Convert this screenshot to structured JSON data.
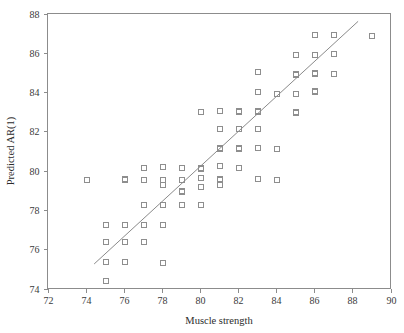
{
  "chart_data": {
    "type": "scatter",
    "title": "",
    "xlabel": "Muscle strength",
    "ylabel": "Predicted AR(1)",
    "xlim": [
      72,
      90
    ],
    "ylim": [
      74,
      88
    ],
    "xticks": [
      72,
      74,
      76,
      78,
      80,
      82,
      84,
      86,
      88,
      90
    ],
    "yticks": [
      74,
      76,
      78,
      80,
      82,
      84,
      86,
      88
    ],
    "grid": false,
    "legend": null,
    "marker": "open-square",
    "marker_color": "#8e8e8e",
    "line_color": "#8a8a8a",
    "frame_color": "#8c8c8c",
    "points": [
      [
        74.0,
        79.6
      ],
      [
        75.0,
        77.3
      ],
      [
        75.0,
        76.4
      ],
      [
        75.0,
        75.4
      ],
      [
        75.0,
        74.45
      ],
      [
        76.0,
        79.65
      ],
      [
        76.0,
        79.6
      ],
      [
        76.0,
        77.3
      ],
      [
        76.0,
        76.4
      ],
      [
        76.0,
        75.4
      ],
      [
        77.0,
        80.2
      ],
      [
        77.0,
        79.6
      ],
      [
        77.0,
        78.3
      ],
      [
        77.0,
        77.3
      ],
      [
        77.0,
        76.4
      ],
      [
        78.0,
        80.25
      ],
      [
        78.0,
        79.6
      ],
      [
        78.0,
        79.3
      ],
      [
        78.0,
        78.3
      ],
      [
        78.0,
        77.3
      ],
      [
        78.0,
        75.35
      ],
      [
        79.0,
        80.2
      ],
      [
        79.0,
        79.6
      ],
      [
        79.0,
        79.0
      ],
      [
        79.0,
        78.95
      ],
      [
        79.0,
        78.3
      ],
      [
        80.0,
        83.05
      ],
      [
        80.0,
        80.2
      ],
      [
        80.0,
        80.15
      ],
      [
        80.0,
        79.7
      ],
      [
        80.0,
        79.2
      ],
      [
        80.0,
        78.3
      ],
      [
        81.0,
        83.1
      ],
      [
        81.0,
        82.15
      ],
      [
        81.0,
        81.2
      ],
      [
        81.0,
        81.15
      ],
      [
        81.0,
        80.3
      ],
      [
        81.0,
        79.65
      ],
      [
        81.0,
        79.6
      ],
      [
        81.0,
        79.3
      ],
      [
        82.0,
        83.1
      ],
      [
        82.0,
        83.05
      ],
      [
        82.0,
        82.15
      ],
      [
        82.0,
        81.2
      ],
      [
        82.0,
        81.15
      ],
      [
        82.0,
        80.2
      ],
      [
        83.0,
        85.05
      ],
      [
        83.0,
        84.05
      ],
      [
        83.0,
        83.1
      ],
      [
        83.0,
        83.05
      ],
      [
        83.0,
        82.15
      ],
      [
        83.0,
        81.2
      ],
      [
        83.0,
        79.65
      ],
      [
        84.0,
        83.95
      ],
      [
        84.0,
        81.15
      ],
      [
        84.0,
        79.6
      ],
      [
        85.0,
        85.95
      ],
      [
        85.0,
        84.95
      ],
      [
        85.0,
        84.9
      ],
      [
        85.0,
        83.95
      ],
      [
        85.0,
        83.05
      ],
      [
        85.0,
        83.0
      ],
      [
        86.0,
        86.95
      ],
      [
        86.0,
        85.95
      ],
      [
        86.0,
        85.0
      ],
      [
        86.0,
        84.95
      ],
      [
        86.0,
        84.1
      ],
      [
        86.0,
        84.05
      ],
      [
        87.0,
        86.95
      ],
      [
        87.0,
        86.0
      ],
      [
        87.0,
        84.95
      ],
      [
        89.0,
        86.9
      ]
    ],
    "fit_line": {
      "name": "regression-line",
      "x": [
        74.45,
        88.3
      ],
      "y": [
        75.25,
        87.6
      ]
    }
  }
}
